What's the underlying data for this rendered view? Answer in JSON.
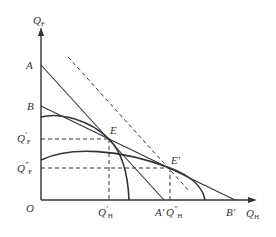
{
  "diagram": {
    "type": "production-possibility-frontier",
    "axes": {
      "y_label": "Q",
      "y_sub": "F",
      "x_label": "Q",
      "x_sub": "H",
      "origin": "O"
    },
    "points": {
      "A": "A",
      "B": "B",
      "A_prime": "A′",
      "B_prime": "B′",
      "E": "E",
      "E_prime": "E′"
    },
    "ticks": {
      "qf_prime": {
        "main": "Q",
        "mark": "′",
        "sub": "F"
      },
      "qf_dprime": {
        "main": "Q",
        "mark": "″",
        "sub": "F"
      },
      "qh_prime": {
        "main": "Q",
        "mark": "′",
        "sub": "H"
      },
      "qh_dprime": {
        "main": "Q",
        "mark": "″",
        "sub": "H"
      }
    },
    "colors": {
      "line": "#333333",
      "background": "#ffffff"
    }
  }
}
